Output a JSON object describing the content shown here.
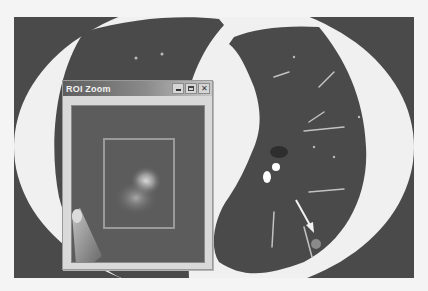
{
  "figure": {
    "caption_fragment": "",
    "colors": {
      "lung_parenchyma": "#4a4a4a",
      "soft_tissue": "#f0f0f0",
      "background": "#f4f4f4",
      "roi_box": "#9a9a9a"
    }
  },
  "roi_window": {
    "title": "ROI Zoom",
    "buttons": {
      "minimize": "_",
      "maximize": "□",
      "close": "✕"
    }
  },
  "annotations": {
    "arrow": "arrow pointing to nodule in left lung lower region"
  }
}
